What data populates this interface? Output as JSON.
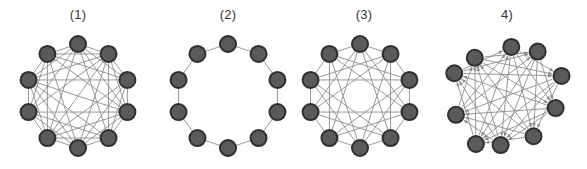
{
  "figure": {
    "width": 587,
    "height": 169,
    "background_color": "#ffffff"
  },
  "style": {
    "node_fill": "#5a5a5a",
    "node_stroke": "#2f2f2f",
    "edge_color": "#8d8d8d",
    "label_color": "#333333",
    "node_radius": 8,
    "node_stroke_width": 2,
    "edge_width": 0.9
  },
  "panels": [
    {
      "id": "panel-1",
      "label": "(1)",
      "x": 4,
      "width": 148,
      "center_x": 74,
      "center_y": 68,
      "radius": 52,
      "node_count": 10,
      "start_angle_deg": -90,
      "directed": false,
      "density": "near-complete",
      "edge_offsets": [
        1,
        2,
        3,
        4,
        5
      ],
      "removed_edges": [
        [
          0,
          5
        ],
        [
          2,
          7
        ],
        [
          4,
          9
        ]
      ],
      "jitter": 0
    },
    {
      "id": "panel-2",
      "label": "(2)",
      "x": 154,
      "width": 148,
      "center_x": 74,
      "center_y": 68,
      "radius": 52,
      "node_count": 10,
      "start_angle_deg": -90,
      "directed": false,
      "density": "ring",
      "edge_offsets": [
        1
      ],
      "removed_edges": [],
      "jitter": 0
    },
    {
      "id": "panel-3",
      "label": "(3)",
      "x": 290,
      "width": 148,
      "center_x": 70,
      "center_y": 68,
      "radius": 52,
      "node_count": 10,
      "start_angle_deg": -90,
      "directed": false,
      "density": "medium",
      "edge_offsets": [
        1,
        3,
        4
      ],
      "removed_edges": [],
      "jitter": 0
    },
    {
      "id": "panel-4",
      "label": "4)",
      "x": 432,
      "width": 150,
      "center_x": 74,
      "center_y": 68,
      "radius": 52,
      "node_count": 10,
      "start_angle_deg": -90,
      "directed": true,
      "density": "medium-directed",
      "edge_offsets": [
        2,
        3,
        4,
        5
      ],
      "removed_edges": [],
      "jitter": 1
    }
  ],
  "diagram_data": {
    "type": "node-link-graph-series",
    "node_count_per_graph": 10,
    "layout": "circular",
    "graphs": [
      {
        "label": "(1)",
        "directed": false,
        "edge_offsets": [
          1,
          2,
          3,
          4,
          5
        ],
        "note": "densest graph, nearly complete"
      },
      {
        "label": "(2)",
        "directed": false,
        "edge_offsets": [
          1
        ],
        "note": "simple cycle / ring, nearest neighbours only"
      },
      {
        "label": "(3)",
        "directed": false,
        "edge_offsets": [
          1,
          3,
          4
        ],
        "note": "circulant graph with medium chord density"
      },
      {
        "label": "4)",
        "directed": true,
        "edge_offsets": [
          2,
          3,
          4,
          5
        ],
        "note": "directed graph with arrowheads, irregular node placement"
      }
    ]
  }
}
